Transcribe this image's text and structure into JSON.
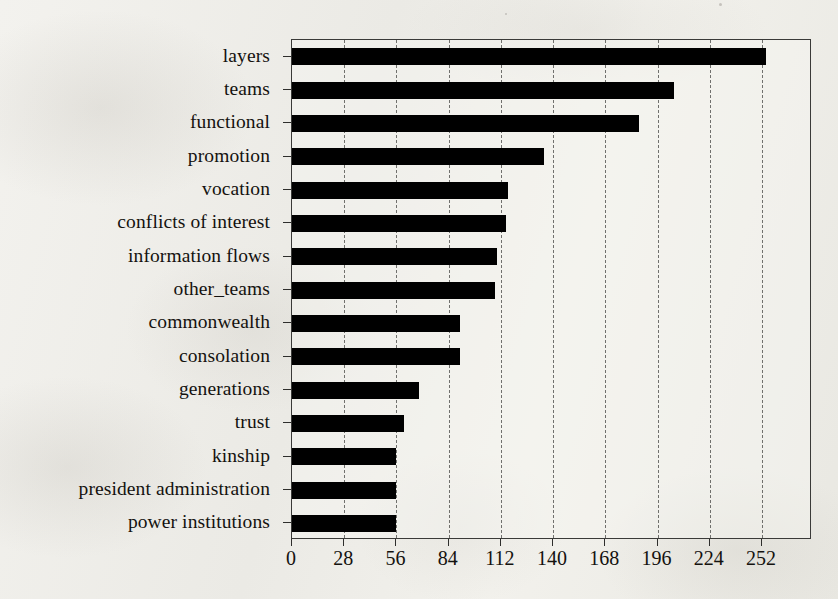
{
  "chart_data": {
    "type": "bar",
    "orientation": "horizontal",
    "title": "",
    "subtitle": "",
    "xlabel": "",
    "ylabel": "",
    "categories": [
      "layers",
      "teams",
      "functional",
      "promotion",
      "vocation",
      "conflicts of interest",
      "information flows",
      "other_teams",
      "commonwealth",
      "consolation",
      "generations",
      "trust",
      "kinship",
      "president administration",
      "power institutions"
    ],
    "values": [
      254,
      205,
      186,
      135,
      116,
      115,
      110,
      109,
      90,
      90,
      68,
      60,
      56,
      56,
      56
    ],
    "xlim": [
      0,
      278.8
    ],
    "xticks": [
      0,
      28,
      56,
      84,
      112,
      140,
      168,
      196,
      224,
      252
    ],
    "xtick_labels": [
      "0",
      "28",
      "56",
      "84",
      "112",
      "140",
      "168",
      "196",
      "224",
      "252"
    ],
    "grid": true,
    "grid_axis": "x",
    "grid_style": "dashed",
    "legend": null,
    "bar_color": "#000000",
    "frame_color": "#3a3a38",
    "background_color": "#efeeea"
  }
}
